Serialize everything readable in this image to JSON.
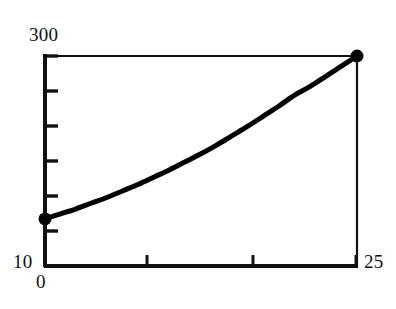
{
  "chart_data": {
    "type": "line",
    "title": "",
    "xlabel": "",
    "ylabel": "",
    "xlim": [
      0,
      25
    ],
    "ylim": [
      10,
      300
    ],
    "grid": false,
    "legend": null,
    "axis_color": "#111111",
    "line_color": "#000000",
    "marker_color": "#000000",
    "background": "#ffffff",
    "x_tick_labels": [
      "0",
      "25"
    ],
    "y_tick_labels": [
      "300",
      "10"
    ],
    "x_tick_values": [
      0,
      25
    ],
    "y_tick_values": [
      10,
      300
    ],
    "x_minor_tick_values": [
      8.2,
      16.6
    ],
    "y_minor_tick_values": [
      48,
      96,
      145,
      193,
      252
    ],
    "series": [
      {
        "name": "curve",
        "x": [
          0,
          1.25,
          2.5,
          3.75,
          5,
          6.25,
          7.5,
          8.75,
          10,
          11.25,
          12.5,
          13.75,
          15,
          16.25,
          17.5,
          18.75,
          20,
          21.25,
          22.5,
          23.75,
          25
        ],
        "y": [
          75,
          82,
          89,
          97,
          105,
          114,
          123,
          133,
          143,
          154,
          165,
          177,
          190,
          203,
          217,
          231,
          246,
          258,
          272,
          286,
          300
        ],
        "marked_points": [
          {
            "x": 0,
            "y": 75
          },
          {
            "x": 25,
            "y": 300
          }
        ]
      }
    ]
  },
  "labels": {
    "y_max": "300",
    "y_min": "10",
    "x_min": "0",
    "x_max": "25"
  }
}
